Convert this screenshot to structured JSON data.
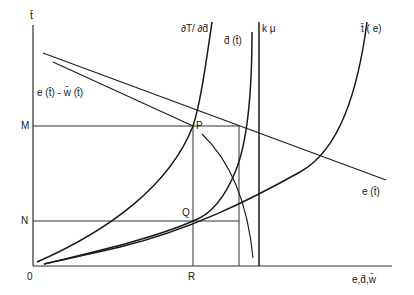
{
  "figure": {
    "axes": {
      "y_label": "t̄",
      "x_label": "e,d̄,w̄",
      "origin_label": "0"
    },
    "points": {
      "M": "M",
      "N": "N",
      "R": "R",
      "P": "P",
      "Q": "Q"
    },
    "curves": {
      "dT_dd": "∂T/ ∂d̄",
      "d_t": "d̄ (t̄)",
      "k_mu": "k μ",
      "t_e": "t̄ ( e)",
      "e_minus_w": "e (t̄) - w̄ (t̄)",
      "e_t": "e (t̄)"
    },
    "colors": {
      "ink": "#1a1a1a",
      "background": "#ffffff"
    }
  }
}
